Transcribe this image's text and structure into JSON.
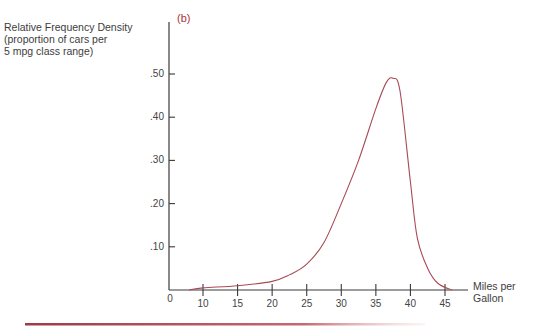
{
  "chart_data": {
    "type": "line",
    "panel_label": "(b)",
    "title": "",
    "ylabel_lines": [
      "Relative Frequency Density",
      "(proportion of cars per",
      "5 mpg class range)"
    ],
    "xlabel_lines": [
      "Miles per",
      "Gallon"
    ],
    "origin_label": "0",
    "x_ticks": [
      10,
      15,
      20,
      25,
      30,
      35,
      40,
      45
    ],
    "y_ticks": [
      ".10",
      ".20",
      ".30",
      ".40",
      ".50"
    ],
    "xlim": [
      0,
      48
    ],
    "ylim": [
      0,
      0.55
    ],
    "grid": false,
    "legend": null,
    "series": [
      {
        "name": "Relative Frequency Density",
        "color": "#a84a55",
        "x": [
          8,
          10,
          15,
          20,
          22.5,
          25,
          27.5,
          30,
          32.5,
          35,
          36.5,
          37.5,
          38.5,
          40,
          41,
          42.5,
          44,
          46
        ],
        "values": [
          0.0,
          0.005,
          0.01,
          0.02,
          0.035,
          0.06,
          0.11,
          0.2,
          0.3,
          0.42,
          0.48,
          0.49,
          0.46,
          0.25,
          0.12,
          0.05,
          0.015,
          0.0
        ]
      }
    ]
  },
  "colors": {
    "curve": "#a84a55",
    "axis": "#3a3a3a",
    "rule": "#9e3a44"
  }
}
